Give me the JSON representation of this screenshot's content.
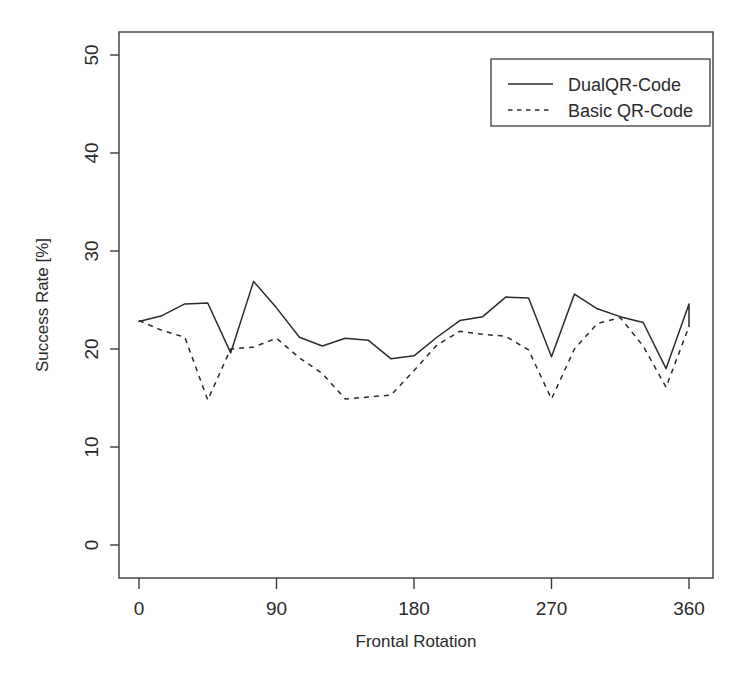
{
  "chart_data": {
    "type": "line",
    "title": "",
    "subtitle": "",
    "xlabel": "Frontal Rotation",
    "ylabel": "Success Rate [%]",
    "xlim": [
      -8,
      368
    ],
    "ylim": [
      -1.5,
      53
    ],
    "grid": false,
    "legend_position": "top-right",
    "x_ticks": [
      0,
      90,
      180,
      270,
      360
    ],
    "x_tick_labels": [
      "0",
      "90",
      "180",
      "270",
      "360"
    ],
    "y_ticks": [
      0,
      10,
      20,
      30,
      40,
      50
    ],
    "y_tick_labels": [
      "0",
      "10",
      "20",
      "30",
      "40",
      "50"
    ],
    "x": [
      0,
      15,
      30,
      45,
      60,
      75,
      90,
      105,
      120,
      135,
      150,
      165,
      180,
      195,
      210,
      225,
      240,
      255,
      270,
      285,
      300,
      315,
      330,
      345,
      360
    ],
    "series": [
      {
        "name": "DualQR-Code",
        "style": "solid",
        "color": "#2b2b2b",
        "values": [
          22.8,
          23.4,
          24.6,
          24.7,
          19.6,
          26.9,
          24.2,
          21.2,
          20.3,
          21.1,
          20.9,
          19.0,
          19.3,
          21.2,
          22.9,
          23.3,
          25.3,
          25.2,
          19.2,
          25.6,
          24.1,
          23.3,
          22.7,
          18.0,
          24.6
        ],
        "final_value": 22.3
      },
      {
        "name": "Basic QR-Code",
        "style": "dashed",
        "color": "#2b2b2b",
        "values": [
          22.9,
          21.9,
          21.2,
          14.8,
          20.0,
          20.2,
          21.1,
          19.1,
          17.5,
          14.9,
          15.1,
          15.3,
          17.8,
          20.4,
          21.8,
          21.5,
          21.3,
          19.9,
          14.9,
          20.0,
          22.6,
          23.2,
          20.3,
          16.1,
          22.3
        ],
        "final_value": 22.3
      }
    ]
  },
  "legend": {
    "entries": [
      {
        "label": "DualQR-Code",
        "style": "solid"
      },
      {
        "label": "Basic QR-Code",
        "style": "dashed"
      }
    ]
  },
  "axes": {
    "x_title": "Frontal Rotation",
    "y_title": "Success Rate [%]"
  }
}
